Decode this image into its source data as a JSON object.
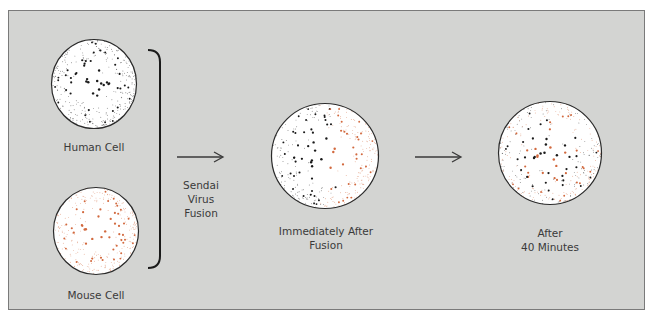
{
  "diagram": {
    "type": "cell-fusion-membrane-protein-diffusion",
    "colors": {
      "background": "#d3d4d2",
      "frame_border": "#7a7a7a",
      "human_protein": "#1a1a1a",
      "mouse_protein": "#d2693e",
      "cell_fill": "#ffffff",
      "cell_outline": "#2a2a2a",
      "label": "#3a3a3a"
    },
    "cells": [
      {
        "id": "human",
        "label": "Human Cell",
        "markers": "black"
      },
      {
        "id": "mouse",
        "label": "Mouse Cell",
        "markers": "orange"
      },
      {
        "id": "fused-immediate",
        "label_line1": "Immediately After",
        "label_line2": "Fusion",
        "markers": "segregated"
      },
      {
        "id": "fused-40min",
        "label_line1": "After",
        "label_line2": "40 Minutes",
        "markers": "intermixed"
      }
    ],
    "process": {
      "label_line1": "Sendai",
      "label_line2": "Virus",
      "label_line3": "Fusion"
    }
  }
}
